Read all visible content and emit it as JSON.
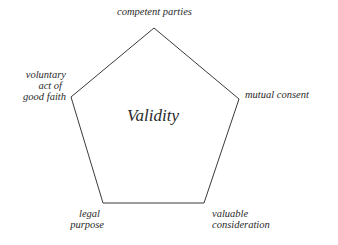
{
  "diagram": {
    "type": "pentagon",
    "center_label": "Validity",
    "stroke_color": "#3a3a3a",
    "vertices": [
      {
        "id": "top",
        "label": "competent parties"
      },
      {
        "id": "right",
        "label": "mutual consent"
      },
      {
        "id": "bottom-right",
        "label_lines": [
          "valuable",
          "consideration"
        ]
      },
      {
        "id": "bottom-left",
        "label_lines": [
          "legal",
          "purpose"
        ]
      },
      {
        "id": "left",
        "label_lines": [
          "voluntary",
          "act of",
          "good faith"
        ]
      }
    ]
  }
}
